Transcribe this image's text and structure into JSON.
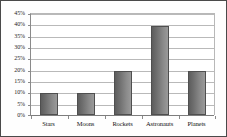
{
  "chart_data": {
    "type": "bar",
    "title": "",
    "xlabel": "",
    "ylabel": "",
    "categories": [
      "Stars",
      "Moons",
      "Rockets",
      "Astronauts",
      "Planets"
    ],
    "values": [
      10,
      10,
      20,
      40,
      20
    ],
    "value_suffix": "%",
    "ylim": [
      0,
      45
    ],
    "ytick_step": 5,
    "ytick_labels": [
      "0%",
      "5%",
      "10%",
      "15%",
      "20%",
      "25%",
      "30%",
      "35%",
      "40%",
      "45%"
    ],
    "ytick_values": [
      0,
      5,
      10,
      15,
      20,
      25,
      30,
      35,
      40,
      45
    ],
    "grid": true,
    "grid_orientation": "horizontal",
    "legend": false,
    "legend_position": "none",
    "colors": {
      "bar_fill_dark": "#5d5d5d",
      "bar_fill_light": "#9a9a9a",
      "bar_border": "#4f4f4f",
      "gridline": "#b9b9b9",
      "axis": "#7d7d7d",
      "frame_border": "#4a4a4a",
      "plot_background": "#ffffff",
      "text": "#121212"
    }
  }
}
